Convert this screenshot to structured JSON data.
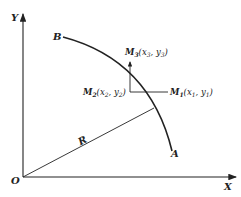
{
  "diagram": {
    "axes": {
      "x_label": "X",
      "y_label": "Y",
      "origin_label": "O"
    },
    "arc": {
      "start_label": "B",
      "end_label": "A"
    },
    "radius_label": "R",
    "points": [
      {
        "id": "M3",
        "name": "M",
        "sub": "3",
        "coord_text": "(x",
        "x_sub": "3",
        "sep": ",  y",
        "y_sub": "3",
        "close": ")"
      },
      {
        "id": "M2",
        "name": "M",
        "sub": "2",
        "coord_text": "(x",
        "x_sub": "2",
        "sep": ",  y",
        "y_sub": "2",
        "close": ")"
      },
      {
        "id": "M1",
        "name": "M",
        "sub": "1",
        "coord_text": "(x",
        "x_sub": "1",
        "sep": ",  y",
        "y_sub": "1",
        "close": ")"
      }
    ],
    "colors": {
      "stroke": "#222222",
      "background": "#ffffff"
    }
  }
}
